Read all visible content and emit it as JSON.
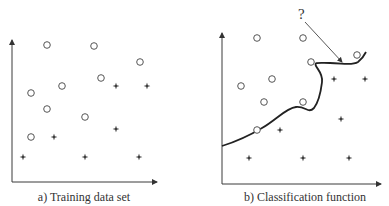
{
  "panels": [
    {
      "id": "a",
      "caption": "a) Training data set",
      "axes": {
        "origin": [
          12,
          182
        ],
        "y_top": 40,
        "x_right": 157
      },
      "circles": [
        [
          47,
          45
        ],
        [
          94,
          46
        ],
        [
          140,
          62
        ],
        [
          101,
          78
        ],
        [
          62,
          86
        ],
        [
          31,
          93
        ],
        [
          47,
          109
        ],
        [
          85,
          117
        ],
        [
          31,
          137
        ]
      ],
      "stars": [
        [
          116,
          86
        ],
        [
          147,
          86
        ],
        [
          116,
          129
        ],
        [
          54,
          137
        ],
        [
          23,
          157
        ],
        [
          85,
          157
        ],
        [
          139,
          157
        ]
      ]
    },
    {
      "id": "b",
      "caption": "b) Classification function",
      "axes": {
        "origin": [
          222,
          184
        ],
        "y_top": 33,
        "x_right": 381
      },
      "circles": [
        [
          257,
          38
        ],
        [
          303,
          38
        ],
        [
          357,
          55
        ],
        [
          311,
          62
        ],
        [
          272,
          79
        ],
        [
          241,
          86
        ],
        [
          264,
          102
        ],
        [
          303,
          102
        ],
        [
          257,
          130
        ]
      ],
      "stars": [
        [
          334,
          79
        ],
        [
          365,
          79
        ],
        [
          341,
          119
        ],
        [
          280,
          130
        ],
        [
          249,
          158
        ],
        [
          303,
          158
        ],
        [
          349,
          158
        ]
      ],
      "boundary_path": "M222,146 C238,141 252,134 262,128 C276,120 286,108 296,107 C306,106 308,114 314,108 C320,100 321,90 322,82 C323,74 318,70 316,66 C314,62 318,63 330,63 C342,63 352,66 358,62 C362,59 364,56 366,52",
      "question": {
        "label": "?",
        "pos": [
          298,
          19
        ],
        "arrow_from": [
          305,
          22
        ],
        "arrow_to": [
          342,
          62
        ]
      }
    }
  ]
}
